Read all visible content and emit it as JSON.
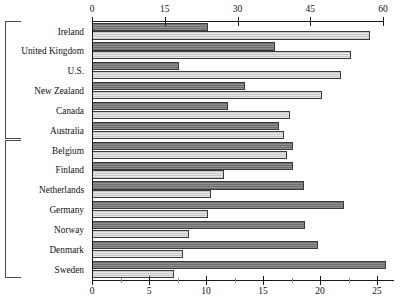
{
  "chart_data": {
    "type": "bar",
    "orientation": "horizontal",
    "title": "",
    "subtitle": "",
    "xlabel": "",
    "ylabel": "",
    "grid": false,
    "legend_position": "none",
    "categories": [
      "Ireland",
      "United Kingdom",
      "U.S.",
      "New Zealand",
      "Canada",
      "Australia",
      "Belgium",
      "Finland",
      "Netherlands",
      "Germany",
      "Norway",
      "Denmark",
      "Sweden"
    ],
    "axes": [
      {
        "name": "top",
        "position": "top",
        "lim": [
          0,
          60
        ],
        "ticks": [
          0,
          15,
          30,
          45,
          60
        ],
        "tick_labels": [
          "0",
          "15",
          "30",
          "45",
          "60"
        ],
        "applies_to_series": "series-1"
      },
      {
        "name": "bottom",
        "position": "bottom",
        "lim": [
          0,
          26.5
        ],
        "ticks": [
          0,
          5,
          10,
          15,
          20,
          25
        ],
        "tick_labels": [
          "0",
          "5",
          "10",
          "15",
          "20",
          "25"
        ],
        "minor_ticks": [
          2.5,
          7.5,
          12.5,
          17.5,
          22.5
        ],
        "applies_to_series": "series-2"
      }
    ],
    "series": [
      {
        "name": "series-1",
        "axis": "top",
        "color": "#6f6f6f",
        "fill": "dark-hatched",
        "values": [
          24.0,
          37.7,
          18.0,
          31.5,
          28.0,
          38.5,
          41.4,
          41.4,
          43.7,
          52.0,
          44.0,
          46.6,
          60.7
        ]
      },
      {
        "name": "series-2",
        "axis": "bottom",
        "color": "#c9c9c9",
        "fill": "light-hatched",
        "values": [
          24.4,
          22.7,
          21.8,
          20.2,
          17.4,
          16.8,
          17.1,
          11.6,
          10.4,
          10.2,
          8.5,
          8.0,
          7.2
        ]
      }
    ],
    "groups": [
      {
        "label": "",
        "first_index": 0,
        "last_index": 5
      },
      {
        "label": "",
        "first_index": 6,
        "last_index": 12
      }
    ]
  }
}
